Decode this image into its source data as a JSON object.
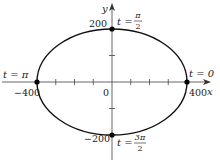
{
  "diagram": {
    "type": "parametric-ellipse",
    "axes": {
      "x_label": "x",
      "y_label": "y",
      "origin_label": "0",
      "x_tick_labels": {
        "neg": "−400",
        "pos": "400"
      },
      "y_tick_labels": {
        "pos": "200",
        "neg": "−200"
      },
      "x_range": [
        -400,
        400
      ],
      "y_range": [
        -200,
        200
      ],
      "x_tick_step": 100,
      "y_tick_step": 100
    },
    "curve": {
      "shape": "ellipse",
      "semi_major_x": 400,
      "semi_minor_y": 200
    },
    "points": [
      {
        "t_label": "t = 0",
        "x": 400,
        "y": 0,
        "name": "point-t-0"
      },
      {
        "t_prefix": "t =",
        "t_num": "π",
        "t_den": "2",
        "x": 0,
        "y": 200,
        "name": "point-t-pi-over-2"
      },
      {
        "t_label": "t = π",
        "x": -400,
        "y": 0,
        "name": "point-t-pi"
      },
      {
        "t_prefix": "t =",
        "t_num": "3π",
        "t_den": "2",
        "x": 0,
        "y": -200,
        "name": "point-t-3pi-over-2"
      }
    ],
    "colors": {
      "curve": "#111111",
      "axes": "#555555",
      "points": "#000000",
      "background": "#ffffff"
    }
  }
}
